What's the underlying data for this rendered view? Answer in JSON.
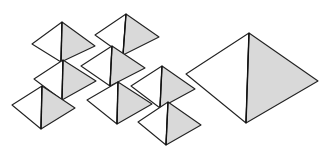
{
  "diagram": {
    "colors": {
      "light_face": "#ffffff",
      "shaded_face": "#d9d9d9",
      "edge": "#222222",
      "background": "#ffffff"
    },
    "pyramids": [
      {
        "id": "small-1",
        "apex": [
          62,
          22
        ],
        "left": [
          32,
          44
        ],
        "right": [
          95,
          46
        ],
        "bottom": [
          61,
          62
        ]
      },
      {
        "id": "small-2",
        "apex": [
          126,
          14
        ],
        "left": [
          95,
          35
        ],
        "right": [
          159,
          37
        ],
        "bottom": [
          123,
          55
        ]
      },
      {
        "id": "small-3",
        "apex": [
          63,
          60
        ],
        "left": [
          34,
          79
        ],
        "right": [
          96,
          81
        ],
        "bottom": [
          62,
          100
        ]
      },
      {
        "id": "small-4",
        "apex": [
          112,
          46
        ],
        "left": [
          81,
          66
        ],
        "right": [
          145,
          68
        ],
        "bottom": [
          110,
          86
        ]
      },
      {
        "id": "small-5",
        "apex": [
          42,
          86
        ],
        "left": [
          12,
          105
        ],
        "right": [
          75,
          108
        ],
        "bottom": [
          41,
          129
        ]
      },
      {
        "id": "small-6",
        "apex": [
          118,
          82
        ],
        "left": [
          87,
          100
        ],
        "right": [
          152,
          104
        ],
        "bottom": [
          117,
          124
        ]
      },
      {
        "id": "small-7",
        "apex": [
          162,
          66
        ],
        "left": [
          131,
          86
        ],
        "right": [
          195,
          89
        ],
        "bottom": [
          160,
          108
        ]
      },
      {
        "id": "small-8",
        "apex": [
          168,
          102
        ],
        "left": [
          138,
          122
        ],
        "right": [
          201,
          125
        ],
        "bottom": [
          166,
          145
        ]
      },
      {
        "id": "large",
        "apex": [
          249,
          33
        ],
        "left": [
          186,
          74
        ],
        "right": [
          318,
          81
        ],
        "bottom": [
          246,
          123
        ]
      }
    ]
  }
}
